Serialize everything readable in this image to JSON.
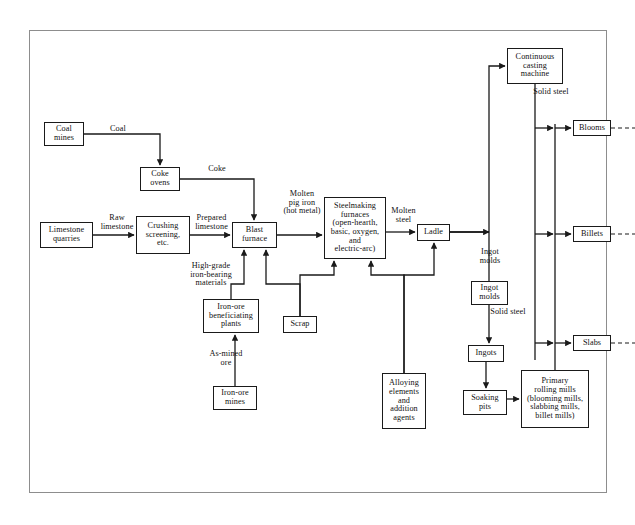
{
  "diagram": {
    "frame_color": "#8d8d8d",
    "line_color": "#1a1a1a",
    "background": "#ffffff",
    "nodes": [
      {
        "id": "coal-mines",
        "label": "Coal\nmines",
        "x": 44,
        "y": 122,
        "w": 40,
        "h": 24
      },
      {
        "id": "coke-ovens",
        "label": "Coke\novens",
        "x": 140,
        "y": 167,
        "w": 40,
        "h": 24
      },
      {
        "id": "limestone-quarries",
        "label": "Limestone\nquarries",
        "x": 40,
        "y": 222,
        "w": 53,
        "h": 26
      },
      {
        "id": "crushing",
        "label": "Crushing\nscreening,\netc.",
        "x": 136,
        "y": 216,
        "w": 54,
        "h": 38
      },
      {
        "id": "blast-furnace",
        "label": "Blast\nfurnace",
        "x": 232,
        "y": 222,
        "w": 45,
        "h": 26
      },
      {
        "id": "steelmaking",
        "label": "Steelmaking\nfurnaces\n(open-hearth,\nbasic, oxygen,\nand\nelectric-arc)",
        "x": 324,
        "y": 197,
        "w": 62,
        "h": 62
      },
      {
        "id": "ladle",
        "label": "Ladle",
        "x": 417,
        "y": 224,
        "w": 33,
        "h": 17
      },
      {
        "id": "iron-ore-benef",
        "label": "Iron-ore\nbeneficiating\nplants",
        "x": 203,
        "y": 299,
        "w": 56,
        "h": 34
      },
      {
        "id": "scrap",
        "label": "Scrap",
        "x": 283,
        "y": 316,
        "w": 34,
        "h": 17
      },
      {
        "id": "iron-ore-mines",
        "label": "Iron-ore\nmines",
        "x": 213,
        "y": 386,
        "w": 44,
        "h": 24
      },
      {
        "id": "alloying",
        "label": "Alloying\nelements\nand\naddition\nagents",
        "x": 382,
        "y": 373,
        "w": 44,
        "h": 56
      },
      {
        "id": "continuous-casting",
        "label": "Continuous\ncasting\nmachine",
        "x": 507,
        "y": 48,
        "w": 56,
        "h": 36
      },
      {
        "id": "ingot-molds",
        "label": "Ingot\nmolds",
        "x": 471,
        "y": 281,
        "w": 37,
        "h": 24
      },
      {
        "id": "ingots",
        "label": "Ingots",
        "x": 468,
        "y": 345,
        "w": 36,
        "h": 17
      },
      {
        "id": "soaking-pits",
        "label": "Soaking\npits",
        "x": 463,
        "y": 390,
        "w": 44,
        "h": 25
      },
      {
        "id": "primary-rolling",
        "label": "Primary\nrolling mills\n(blooming mills,\nslabbing mills,\nbillet mills)",
        "x": 521,
        "y": 370,
        "w": 68,
        "h": 58
      },
      {
        "id": "blooms",
        "label": "Blooms",
        "x": 573,
        "y": 120,
        "w": 38,
        "h": 16
      },
      {
        "id": "billets",
        "label": "Billets",
        "x": 573,
        "y": 226,
        "w": 38,
        "h": 16
      },
      {
        "id": "slabs",
        "label": "Slabs",
        "x": 573,
        "y": 335,
        "w": 38,
        "h": 16
      }
    ],
    "edge_labels": [
      {
        "id": "coal",
        "text": "Coal",
        "x": 100,
        "y": 125,
        "w": 36
      },
      {
        "id": "coke",
        "text": "Coke",
        "x": 199,
        "y": 165,
        "w": 36
      },
      {
        "id": "raw-limestone",
        "text": "Raw\nlimestone",
        "x": 94,
        "y": 214,
        "w": 46
      },
      {
        "id": "prepared-limestone",
        "text": "Prepared\nlimestone",
        "x": 188,
        "y": 214,
        "w": 47
      },
      {
        "id": "molten-pig-iron",
        "text": "Molten\npig iron\n(hot metal)",
        "x": 278,
        "y": 190,
        "w": 48
      },
      {
        "id": "molten-steel",
        "text": "Molten\nsteel",
        "x": 386,
        "y": 207,
        "w": 35
      },
      {
        "id": "high-grade",
        "text": "High-grade\niron-bearing\nmaterials",
        "x": 183,
        "y": 262,
        "w": 56
      },
      {
        "id": "as-mined-ore",
        "text": "As-mined\nore",
        "x": 204,
        "y": 350,
        "w": 44
      },
      {
        "id": "ingot-molds-lbl",
        "text": "Ingot\nmolds",
        "x": 472,
        "y": 248,
        "w": 36
      },
      {
        "id": "solid-steel-top",
        "text": "Solid steel",
        "x": 527,
        "y": 88,
        "w": 48
      },
      {
        "id": "solid-steel-mid",
        "text": "Solid steel",
        "x": 484,
        "y": 308,
        "w": 48
      }
    ]
  }
}
